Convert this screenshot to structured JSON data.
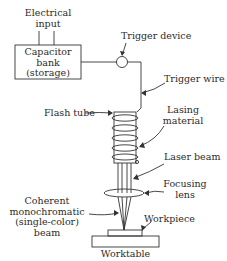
{
  "diagram": {
    "labels": {
      "electrical_input": [
        "Electrical",
        "input"
      ],
      "capacitor_bank": [
        "Capacitor",
        "bank",
        "(storage)"
      ],
      "trigger_device": "Trigger device",
      "trigger_wire": "Trigger wire",
      "flash_tube": "Flash tube",
      "lasing_material": [
        "Lasing",
        "material"
      ],
      "laser_beam": "Laser beam",
      "focusing_lens": [
        "Focusing",
        "lens"
      ],
      "coherent_beam": [
        "Coherent",
        "monochromatic",
        "(single-color)",
        "beam"
      ],
      "workpiece": "Workpiece",
      "worktable": "Worktable"
    },
    "colors": {
      "line": "#333333",
      "background": "#ffffff"
    }
  }
}
